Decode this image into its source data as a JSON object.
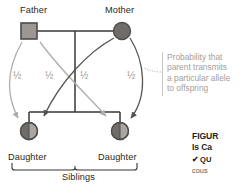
{
  "figure": {
    "people": {
      "father_label": "Father",
      "mother_label": "Mother",
      "daughter_left_label": "Daughter",
      "daughter_right_label": "Daughter",
      "siblings_label": "Siblings"
    },
    "probabilities": {
      "father_to_left": "½",
      "father_to_right": "½",
      "mother_to_left": "½",
      "mother_to_right": "½"
    },
    "callout": {
      "line1": "Probability that",
      "line2": "parent transmits",
      "line3": "a particular allele",
      "line4": "to offspring"
    },
    "caption": {
      "line1": "FIGUR",
      "line2": "Is Ca",
      "check": "✔",
      "question": "QU",
      "body": "cous"
    },
    "colors": {
      "father_fill": "#9a9795",
      "father_stroke": "#4f4c4a",
      "mother_fill": "#6f6c6a",
      "daughter_dark": "#6f6c6a",
      "daughter_light": "#a9a6a3",
      "pedigree_line": "#3a3734",
      "arrow_light": "#b0aeaa",
      "arrow_dark": "#57534f",
      "text": "#2a2724",
      "muted_text": "#a4a09c"
    }
  }
}
